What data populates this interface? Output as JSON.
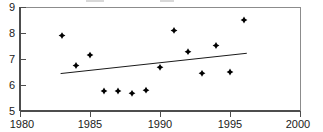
{
  "chart_data": {
    "type": "scatter",
    "title": "",
    "subtitle": "",
    "xlabel": "",
    "ylabel": "",
    "xlim": [
      1980,
      2000
    ],
    "ylim": [
      5,
      9
    ],
    "grid": false,
    "legend": null,
    "x_ticks": [
      1980,
      1985,
      1990,
      1995,
      2000
    ],
    "x_tick_labels": [
      "1980",
      "1985",
      "1990",
      "1995",
      "2000"
    ],
    "y_ticks": [
      5,
      6,
      7,
      8,
      9
    ],
    "y_tick_labels": [
      "5",
      "6",
      "7",
      "8",
      "9"
    ],
    "series": [
      {
        "name": "observations",
        "type": "scatter",
        "marker": "diamond-cross",
        "color": "#000000",
        "points": [
          {
            "x": 1983,
            "y": 7.9
          },
          {
            "x": 1984,
            "y": 6.75
          },
          {
            "x": 1985,
            "y": 7.15
          },
          {
            "x": 1986,
            "y": 5.77
          },
          {
            "x": 1987,
            "y": 5.77
          },
          {
            "x": 1988,
            "y": 5.68
          },
          {
            "x": 1989,
            "y": 5.8
          },
          {
            "x": 1990,
            "y": 6.68
          },
          {
            "x": 1991,
            "y": 8.1
          },
          {
            "x": 1992,
            "y": 7.28
          },
          {
            "x": 1993,
            "y": 6.45
          },
          {
            "x": 1994,
            "y": 7.52
          },
          {
            "x": 1995,
            "y": 6.5
          },
          {
            "x": 1996,
            "y": 8.5
          }
        ]
      },
      {
        "name": "trend-line",
        "type": "line",
        "color": "#1a1a1a",
        "points": [
          {
            "x": 1982.9,
            "y": 6.44
          },
          {
            "x": 1996.2,
            "y": 7.22
          }
        ]
      }
    ]
  }
}
